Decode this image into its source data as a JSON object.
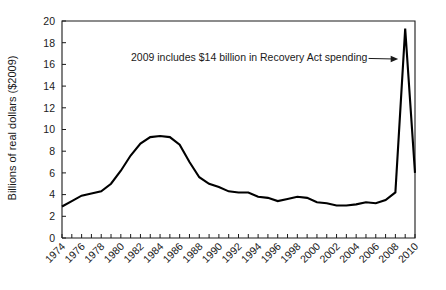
{
  "chart_data": {
    "type": "line",
    "title": "",
    "xlabel": "",
    "ylabel": "Billions of real dollars ($2009)",
    "xlim": [
      1974,
      2010
    ],
    "ylim": [
      0,
      20
    ],
    "ytick_step": 2,
    "xtick_step": 2,
    "grid": false,
    "legend": null,
    "yticks": [
      "0",
      "2",
      "4",
      "6",
      "8",
      "10",
      "12",
      "14",
      "16",
      "18",
      "20"
    ],
    "xticks": [
      "1974",
      "1976",
      "1978",
      "1980",
      "1982",
      "1984",
      "1986",
      "1988",
      "1990",
      "1992",
      "1994",
      "1996",
      "1998",
      "2000",
      "2002",
      "2004",
      "2006",
      "2008",
      "2010"
    ],
    "x": [
      1974,
      1975,
      1976,
      1977,
      1978,
      1979,
      1980,
      1981,
      1982,
      1983,
      1984,
      1985,
      1986,
      1987,
      1988,
      1989,
      1990,
      1991,
      1992,
      1993,
      1994,
      1995,
      1996,
      1997,
      1998,
      1999,
      2000,
      2001,
      2002,
      2003,
      2004,
      2005,
      2006,
      2007,
      2008,
      2009,
      2010
    ],
    "values": [
      2.9,
      3.4,
      3.9,
      4.1,
      4.3,
      5.0,
      6.2,
      7.6,
      8.7,
      9.3,
      9.4,
      9.3,
      8.6,
      7.0,
      5.6,
      5.0,
      4.7,
      4.3,
      4.2,
      4.2,
      3.8,
      3.7,
      3.4,
      3.6,
      3.8,
      3.7,
      3.3,
      3.2,
      3.0,
      3.0,
      3.1,
      3.3,
      3.2,
      3.5,
      4.2,
      19.3,
      6.0
    ],
    "series_name": "Energy efficiency and renewable energy spending",
    "annotations": [
      {
        "text": "2009 includes $14 billion in Recovery Act spending",
        "target_x": 2009,
        "target_y": 16.5
      }
    ],
    "line_color": "#000000",
    "axis_color": "#1a1a1a",
    "background_color": "#ffffff"
  }
}
